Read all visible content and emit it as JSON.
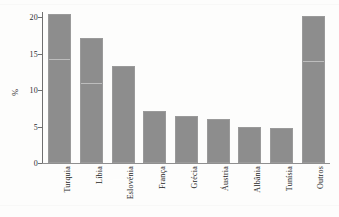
{
  "chart_data": {
    "type": "bar",
    "title": "",
    "xlabel": "",
    "ylabel": "%",
    "ylim": [
      0,
      21
    ],
    "grid": false,
    "legend": false,
    "yticks": [
      0,
      5,
      10,
      15,
      20
    ],
    "ytick_labels": [
      "0",
      "5",
      "10",
      "15",
      "20"
    ],
    "categories": [
      "Turquia",
      "Líbia",
      "Eslovénia",
      "França",
      "Grécia",
      "Áustria",
      "Albânia",
      "Tunísia",
      "Outros"
    ],
    "values": [
      20.5,
      17.2,
      13.3,
      7.1,
      6.4,
      6.1,
      5.0,
      4.85,
      20.2
    ],
    "series": [
      {
        "name": "",
        "values": [
          20.5,
          17.2,
          13.3,
          7.1,
          6.4,
          6.1,
          5.0,
          4.85,
          20.2
        ]
      }
    ]
  },
  "style": {
    "bar_color": "#8d8d8d",
    "bar_border_color": "#9a9a9a",
    "axis_color": "#6f6f6f",
    "text_color": "#1f1f1f",
    "background": "#fdfdfc"
  }
}
